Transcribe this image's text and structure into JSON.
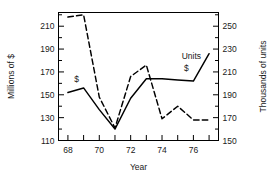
{
  "chart_data": {
    "type": "line",
    "title": "",
    "subtitle": "",
    "xlabel": "Year",
    "ylabel": "Millions of $",
    "y2label": "Thousands of units",
    "x": [
      68,
      69,
      70,
      71,
      72,
      73,
      74,
      75,
      76,
      77
    ],
    "x_tick_labels": [
      "68",
      "",
      "70",
      "",
      "72",
      "",
      "74",
      "",
      "76",
      ""
    ],
    "xlim": [
      67.4,
      77.6
    ],
    "ylim": [
      110,
      222
    ],
    "y2lim": [
      150,
      262
    ],
    "y_ticks": [
      110,
      130,
      150,
      170,
      190,
      210
    ],
    "y_tick_labels": [
      "110",
      "130",
      "150",
      "170",
      "190",
      "210"
    ],
    "y_minor_ticks": [
      120,
      140,
      160,
      180,
      200,
      220
    ],
    "y2_ticks": [
      150,
      170,
      190,
      210,
      230,
      250
    ],
    "y2_tick_labels": [
      "150",
      "170",
      "190",
      "210",
      "230",
      "250"
    ],
    "y2_minor_ticks": [
      160,
      180,
      200,
      220,
      240,
      260
    ],
    "grid": false,
    "legend_position": "inline-annotation",
    "series": [
      {
        "name": "$",
        "axis": "left",
        "style": "solid",
        "color": "#000000",
        "values": [
          152,
          156,
          137,
          120,
          147,
          164,
          164,
          163,
          162,
          186
        ],
        "label_text": "$",
        "label_x": 68.55,
        "label_y": 161,
        "label2_text": "$",
        "label2_x": 75.55,
        "label2_y": 171
      },
      {
        "name": "Units",
        "axis": "right",
        "style": "dashed",
        "color": "#000000",
        "values": [
          258,
          260,
          188,
          161,
          206,
          216,
          169,
          180,
          168,
          168
        ],
        "label_text": "Units",
        "label_x": 75.25,
        "label_y": 181
      }
    ]
  }
}
